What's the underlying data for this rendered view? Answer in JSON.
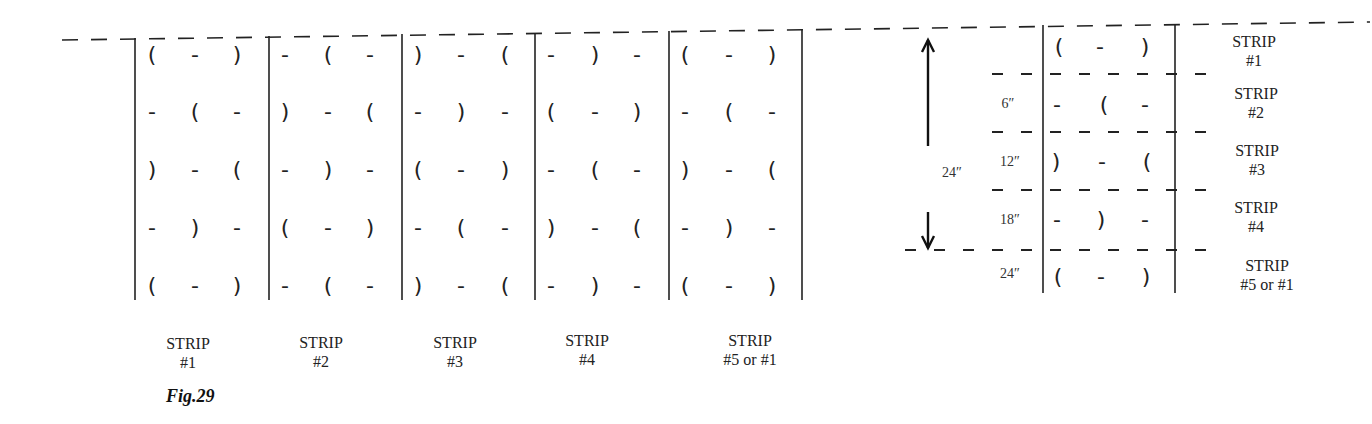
{
  "figure": {
    "caption": "Fig.29"
  },
  "left_layout": {
    "strips": [
      {
        "label": "STRIP",
        "number": "#1",
        "rows": [
          [
            "(",
            "-",
            ")"
          ],
          [
            "-",
            "(",
            "-"
          ],
          [
            ")",
            "-",
            "("
          ],
          [
            "-",
            ")",
            "-"
          ],
          [
            "(",
            "-",
            ")"
          ]
        ]
      },
      {
        "label": "STRIP",
        "number": "#2",
        "rows": [
          [
            "-",
            "(",
            "-"
          ],
          [
            ")",
            "-",
            "("
          ],
          [
            "-",
            ")",
            "-"
          ],
          [
            "(",
            "-",
            ")"
          ],
          [
            "-",
            "(",
            "-"
          ]
        ]
      },
      {
        "label": "STRIP",
        "number": "#3",
        "rows": [
          [
            ")",
            "-",
            "("
          ],
          [
            "-",
            ")",
            "-"
          ],
          [
            "(",
            "-",
            ")"
          ],
          [
            "-",
            "(",
            "-"
          ],
          [
            ")",
            "-",
            "("
          ]
        ]
      },
      {
        "label": "STRIP",
        "number": "#4",
        "rows": [
          [
            "-",
            ")",
            "-"
          ],
          [
            "(",
            "-",
            ")"
          ],
          [
            "-",
            "(",
            "-"
          ],
          [
            ")",
            "-",
            "("
          ],
          [
            "-",
            ")",
            "-"
          ]
        ]
      },
      {
        "label": "STRIP",
        "number": "#5 or #1",
        "rows": [
          [
            "(",
            "-",
            ")"
          ],
          [
            "-",
            "(",
            "-"
          ],
          [
            ")",
            "-",
            "("
          ],
          [
            "-",
            ")",
            "-"
          ],
          [
            "(",
            "-",
            ")"
          ]
        ]
      }
    ]
  },
  "right_layout": {
    "span_label": "24″",
    "rows": [
      {
        "offset": "",
        "symbols": [
          "(",
          "-",
          ")"
        ],
        "label": "STRIP",
        "number": "#1"
      },
      {
        "offset": "6″",
        "symbols": [
          "-",
          "(",
          "-"
        ],
        "label": "STRIP",
        "number": "#2"
      },
      {
        "offset": "12″",
        "symbols": [
          ")",
          "-",
          "("
        ],
        "label": "STRIP",
        "number": "#3"
      },
      {
        "offset": "18″",
        "symbols": [
          "-",
          ")",
          "-"
        ],
        "label": "STRIP",
        "number": "#4"
      },
      {
        "offset": "24″",
        "symbols": [
          "(",
          "-",
          ")"
        ],
        "label": "STRIP",
        "number": "#5 or #1"
      }
    ]
  }
}
